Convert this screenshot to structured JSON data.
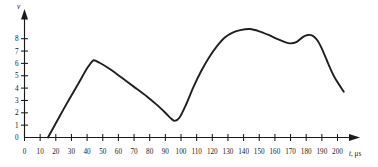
{
  "chart_data": {
    "type": "line",
    "title": "",
    "subtitle": "",
    "xlabel": "t, μs",
    "xlabel_symbol": "t",
    "xlabel_unit": ", μs",
    "ylabel": "v",
    "xlim": [
      0,
      207
    ],
    "ylim": [
      0,
      9.2
    ],
    "grid": false,
    "legend": false,
    "legend_position": "none",
    "line_color": "#1f1f1f",
    "axis_color": "#1a1a1a",
    "background_color": "#ffffff",
    "x_ticks": [
      0,
      10,
      20,
      30,
      40,
      50,
      60,
      70,
      80,
      90,
      100,
      110,
      120,
      130,
      140,
      150,
      160,
      170,
      180,
      190,
      200
    ],
    "x_tick_labels": [
      "0",
      "10",
      "20",
      "30",
      "40",
      "50",
      "60",
      "70",
      "80",
      "90",
      "100",
      "110",
      "120",
      "130",
      "140",
      "150",
      "160",
      "170",
      "180",
      "190",
      "200"
    ],
    "y_ticks": [
      0,
      1,
      2,
      3,
      4,
      5,
      6,
      7,
      8
    ],
    "y_tick_labels": [
      "0",
      "1",
      "2",
      "3",
      "4",
      "5",
      "6",
      "7",
      "8"
    ],
    "series": [
      {
        "name": "v(t)",
        "x": [
          15,
          20,
          25,
          30,
          35,
          40,
          44,
          48,
          55,
          62,
          70,
          78,
          85,
          90,
          94,
          96,
          99,
          103,
          108,
          113,
          118,
          123,
          128,
          133,
          138,
          144,
          150,
          156,
          161,
          166,
          170,
          174,
          178,
          181,
          184,
          187,
          190,
          194,
          198,
          204
        ],
        "y": [
          0.0,
          1.15,
          2.3,
          3.4,
          4.5,
          5.6,
          6.25,
          6.05,
          5.5,
          4.85,
          4.1,
          3.35,
          2.6,
          2.0,
          1.5,
          1.35,
          1.6,
          2.6,
          4.1,
          5.4,
          6.5,
          7.4,
          8.1,
          8.5,
          8.7,
          8.78,
          8.6,
          8.3,
          8.0,
          7.75,
          7.62,
          7.75,
          8.15,
          8.3,
          8.25,
          7.9,
          7.2,
          6.0,
          4.9,
          3.7
        ]
      }
    ],
    "annotations": {
      "curve_start_t": 15,
      "first_peak_t": 44,
      "first_peak_v": 6.25,
      "valley_t": 96,
      "valley_v": 1.35,
      "main_peak_t": 144,
      "main_peak_v": 8.78,
      "local_dip_t": 170,
      "local_dip_v": 7.62,
      "second_peak_t": 181,
      "second_peak_v": 8.3,
      "curve_end_t": 204,
      "curve_end_v": 3.7
    }
  }
}
